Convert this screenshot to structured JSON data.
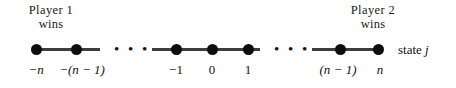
{
  "figure": {
    "type": "number-line-diagram",
    "background_color": "#ffffff",
    "ink_color": "#111111",
    "captions": [
      {
        "id": "player1",
        "line1": "Player 1",
        "line2": "wins"
      },
      {
        "id": "player2",
        "line1": "Player 2",
        "line2": "wins"
      }
    ],
    "state_axis_label": {
      "text": "state",
      "variable": "j"
    },
    "segments": [
      {
        "id": "left-segment",
        "x": 36,
        "width": 64
      },
      {
        "id": "middle-segment",
        "x": 152,
        "width": 108
      },
      {
        "id": "right-segment",
        "x": 312,
        "width": 66
      }
    ],
    "ellipses": [
      {
        "id": "ellipsis-left",
        "x": 114,
        "glyph": "• • •"
      },
      {
        "id": "ellipsis-right",
        "x": 274,
        "glyph": "• • •"
      }
    ],
    "nodes": [
      {
        "id": "node-minus-n",
        "x": 36,
        "label": "−n",
        "label_x": 36
      },
      {
        "id": "node-minus-n-1",
        "x": 76,
        "label": "−(n − 1)",
        "label_x": 82
      },
      {
        "id": "node-minus-1",
        "x": 176,
        "label": "−1",
        "label_x": 176
      },
      {
        "id": "node-zero",
        "x": 212,
        "label": "0",
        "label_x": 212
      },
      {
        "id": "node-one",
        "x": 248,
        "label": "1",
        "label_x": 248
      },
      {
        "id": "node-n-minus-1",
        "x": 340,
        "label": "(n − 1)",
        "label_x": 338
      },
      {
        "id": "node-n",
        "x": 378,
        "label": "n",
        "label_x": 380
      }
    ]
  }
}
